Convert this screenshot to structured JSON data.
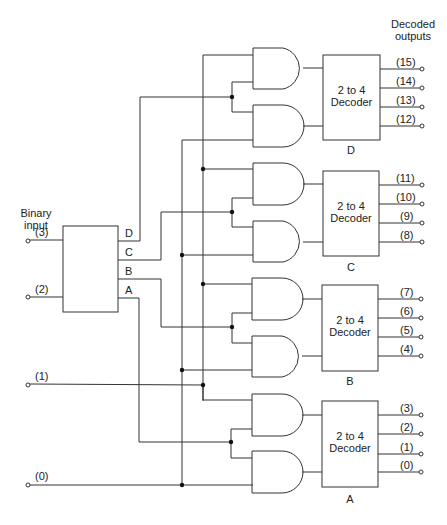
{
  "title": {
    "outputs_line1": "Decoded",
    "outputs_line2": "outputs",
    "input_line1": "Binary",
    "input_line2": "input"
  },
  "inputs": [
    {
      "label": "(3)"
    },
    {
      "label": "(2)"
    },
    {
      "label": "(1)"
    },
    {
      "label": "(0)"
    }
  ],
  "input_block": {
    "outputs": [
      "D",
      "C",
      "B",
      "A"
    ]
  },
  "decoders": [
    {
      "name": "D",
      "label_line1": "2 to 4",
      "label_line2": "Decoder",
      "outputs": [
        "(15)",
        "(14)",
        "(13)",
        "(12)"
      ]
    },
    {
      "name": "C",
      "label_line1": "2 to 4",
      "label_line2": "Decoder",
      "outputs": [
        "(11)",
        "(10)",
        "(9)",
        "(8)"
      ]
    },
    {
      "name": "B",
      "label_line1": "2 to 4",
      "label_line2": "Decoder",
      "outputs": [
        "(7)",
        "(6)",
        "(5)",
        "(4)"
      ]
    },
    {
      "name": "A",
      "label_line1": "2 to 4",
      "label_line2": "Decoder",
      "outputs": [
        "(3)",
        "(2)",
        "(1)",
        "(0)"
      ]
    }
  ],
  "colors": {
    "line": "#333333",
    "background": "#ffffff"
  }
}
